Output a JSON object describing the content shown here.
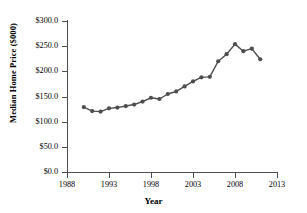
{
  "chart_data": {
    "type": "line",
    "title": "",
    "xlabel": "Year",
    "ylabel": "Median Home Price ($000)",
    "xlim": [
      1988,
      2013
    ],
    "ylim": [
      0,
      300
    ],
    "grid": false,
    "legend": false,
    "marker": "filled-circle",
    "line_color": "#4d4d4d",
    "x": [
      1990,
      1991,
      1992,
      1993,
      1994,
      1995,
      1996,
      1997,
      1998,
      1999,
      2000,
      2001,
      2002,
      2003,
      2004,
      2005,
      2006,
      2007,
      2008,
      2009,
      2010,
      2011
    ],
    "values": [
      129.0,
      121.0,
      120.0,
      126.5,
      128.0,
      131.0,
      134.0,
      140.0,
      147.5,
      145.0,
      155.0,
      160.0,
      170.0,
      180.0,
      188.0,
      189.0,
      220.0,
      234.0,
      254.0,
      240.0,
      245.0,
      224.0
    ],
    "series": [
      {
        "name": "Median Home Price",
        "values": [
          129.0,
          121.0,
          120.0,
          126.5,
          128.0,
          131.0,
          134.0,
          140.0,
          147.5,
          145.0,
          155.0,
          160.0,
          170.0,
          180.0,
          188.0,
          189.0,
          220.0,
          234.0,
          254.0,
          240.0,
          245.0,
          224.0
        ]
      }
    ],
    "y_ticks": [
      0,
      50,
      100,
      150,
      200,
      250,
      300
    ],
    "y_tick_labels": [
      "$0.0",
      "$50.0",
      "$100.0",
      "$150.0",
      "$200.0",
      "$250.0",
      "$300.0"
    ],
    "x_ticks": [
      1988,
      1993,
      1998,
      2003,
      2008,
      2013
    ],
    "x_tick_labels": [
      "1988",
      "1993",
      "1998",
      "2003",
      "2008",
      "2013"
    ]
  }
}
